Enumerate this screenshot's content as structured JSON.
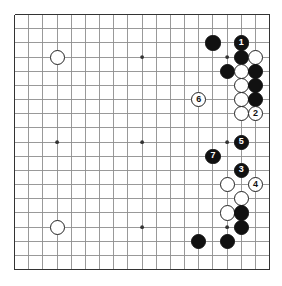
{
  "diagram": {
    "kind": "go-board-diagram",
    "board_size": 19,
    "geometry": {
      "origin_x": 14.6,
      "origin_y": 14.6,
      "spacing": 14.17,
      "stone_radius": 7.6,
      "star_radius": 1.9,
      "border_px": 1.6
    },
    "colors": {
      "background": "#ffffff",
      "grid_line": "#8e8e8e",
      "border_line": "#333333",
      "black_stone": "#111111",
      "white_stone": "#ffffff",
      "white_stone_edge": "#222222",
      "black_label": "#ffffff",
      "white_label": "#111111"
    },
    "star_points": [
      {
        "col": 4,
        "row": 4
      },
      {
        "col": 10,
        "row": 4
      },
      {
        "col": 16,
        "row": 4
      },
      {
        "col": 4,
        "row": 10
      },
      {
        "col": 10,
        "row": 10
      },
      {
        "col": 16,
        "row": 10
      },
      {
        "col": 4,
        "row": 16
      },
      {
        "col": 10,
        "row": 16
      },
      {
        "col": 16,
        "row": 16
      }
    ],
    "stones": [
      {
        "col": 4,
        "row": 4,
        "color": "white",
        "label": ""
      },
      {
        "col": 4,
        "row": 16,
        "color": "white",
        "label": ""
      },
      {
        "col": 15,
        "row": 3,
        "color": "black",
        "label": ""
      },
      {
        "col": 17,
        "row": 3,
        "color": "black",
        "label": "1"
      },
      {
        "col": 17,
        "row": 4,
        "color": "black",
        "label": ""
      },
      {
        "col": 18,
        "row": 4,
        "color": "white",
        "label": ""
      },
      {
        "col": 16,
        "row": 5,
        "color": "black",
        "label": ""
      },
      {
        "col": 17,
        "row": 5,
        "color": "white",
        "label": ""
      },
      {
        "col": 18,
        "row": 5,
        "color": "black",
        "label": ""
      },
      {
        "col": 17,
        "row": 6,
        "color": "white",
        "label": ""
      },
      {
        "col": 18,
        "row": 6,
        "color": "black",
        "label": ""
      },
      {
        "col": 17,
        "row": 7,
        "color": "white",
        "label": ""
      },
      {
        "col": 18,
        "row": 7,
        "color": "black",
        "label": ""
      },
      {
        "col": 17,
        "row": 8,
        "color": "white",
        "label": ""
      },
      {
        "col": 18,
        "row": 8,
        "color": "white",
        "label": "2"
      },
      {
        "col": 14,
        "row": 7,
        "color": "white",
        "label": "6"
      },
      {
        "col": 17,
        "row": 10,
        "color": "black",
        "label": "5"
      },
      {
        "col": 15,
        "row": 11,
        "color": "black",
        "label": "7"
      },
      {
        "col": 17,
        "row": 12,
        "color": "black",
        "label": "3"
      },
      {
        "col": 16,
        "row": 13,
        "color": "white",
        "label": ""
      },
      {
        "col": 18,
        "row": 13,
        "color": "white",
        "label": "4"
      },
      {
        "col": 17,
        "row": 14,
        "color": "white",
        "label": ""
      },
      {
        "col": 16,
        "row": 15,
        "color": "white",
        "label": ""
      },
      {
        "col": 17,
        "row": 15,
        "color": "black",
        "label": ""
      },
      {
        "col": 17,
        "row": 16,
        "color": "black",
        "label": ""
      },
      {
        "col": 14,
        "row": 17,
        "color": "black",
        "label": ""
      },
      {
        "col": 16,
        "row": 17,
        "color": "black",
        "label": ""
      }
    ],
    "move_numbers": [
      "1",
      "2",
      "3",
      "4",
      "5",
      "6",
      "7"
    ]
  }
}
